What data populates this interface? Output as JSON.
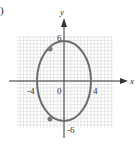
{
  "panel_label": ")",
  "chart_data": {
    "type": "line",
    "title": "",
    "xlabel": "x",
    "ylabel": "y",
    "xlim": [
      -7,
      7
    ],
    "ylim": [
      -7,
      7
    ],
    "grid": true,
    "x_ticks": [
      {
        "value": -4,
        "label": "-4"
      },
      {
        "value": 0,
        "label": "0"
      },
      {
        "value": 4,
        "label": "4"
      }
    ],
    "y_ticks": [
      {
        "value": 6,
        "label": "6"
      },
      {
        "value": -6,
        "label": "-6"
      }
    ],
    "series": [
      {
        "name": "ellipse",
        "shape": "ellipse",
        "center": [
          0,
          0
        ],
        "semi_axis_x": 4,
        "semi_axis_y": 6,
        "equation": "x^2/16 + y^2/36 = 1"
      }
    ],
    "points": [
      {
        "x": -2,
        "y": 5.2
      },
      {
        "x": -2,
        "y": -5.2
      }
    ],
    "colors": {
      "curve": "#6b6b6b",
      "axes": "#333333",
      "grid": "#cccccc",
      "points": "#7a7a7a"
    }
  }
}
